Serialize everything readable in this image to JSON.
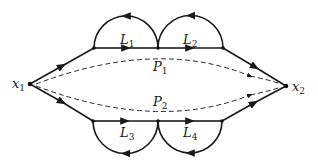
{
  "diagram": {
    "type": "signal-flow-graph",
    "nodes": [
      {
        "id": "x1",
        "label": "x",
        "sub": "1"
      },
      {
        "id": "x2",
        "label": "x",
        "sub": "2"
      }
    ],
    "loops": [
      {
        "id": "L1",
        "label": "L",
        "sub": "1"
      },
      {
        "id": "L2",
        "label": "L",
        "sub": "2"
      },
      {
        "id": "L3",
        "label": "L",
        "sub": "3"
      },
      {
        "id": "L4",
        "label": "L",
        "sub": "4"
      }
    ],
    "paths": [
      {
        "id": "P1",
        "label": "P",
        "sub": "1"
      },
      {
        "id": "P2",
        "label": "P",
        "sub": "2"
      }
    ],
    "colors": {
      "line": "#1a1a1a",
      "background": "#ffffff"
    }
  }
}
